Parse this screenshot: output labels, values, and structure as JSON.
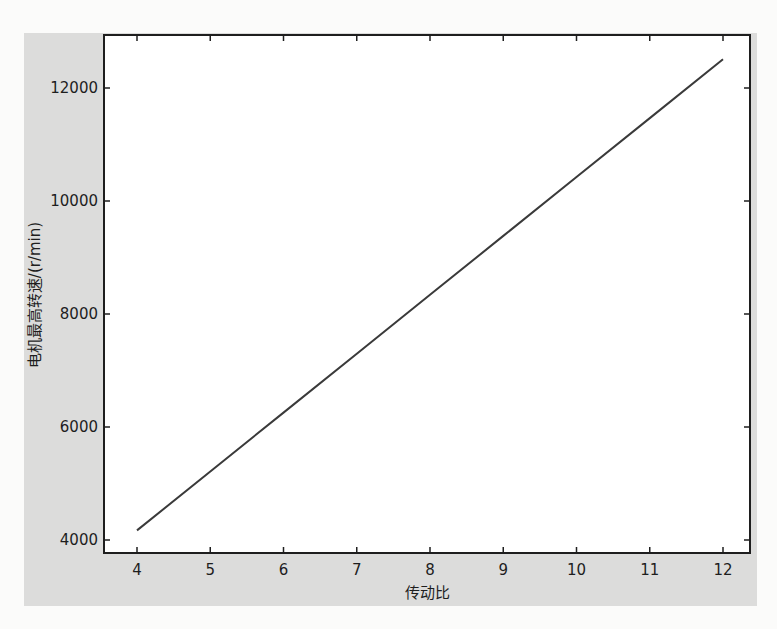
{
  "chart_data": {
    "type": "line",
    "title": "",
    "xlabel": "传动比",
    "ylabel": "电机最高转速/(r/min)",
    "xlim": [
      3.55,
      12.35
    ],
    "ylim": [
      3770,
      13000
    ],
    "x_ticks": [
      4,
      5,
      6,
      7,
      8,
      9,
      10,
      11,
      12
    ],
    "y_ticks": [
      4000,
      6000,
      8000,
      10000,
      12000
    ],
    "grid": false,
    "legend": null,
    "series": [
      {
        "name": "电机最高转速",
        "color": "#3a3a3a",
        "x": [
          4,
          5,
          6,
          7,
          8,
          9,
          10,
          11,
          12
        ],
        "y": [
          4170,
          5213,
          6255,
          7298,
          8340,
          9383,
          10425,
          11468,
          12510
        ]
      }
    ]
  },
  "labels": {
    "xlabel": "传动比",
    "ylabel": "电机最高转速/(r/min)",
    "x_ticks": [
      "4",
      "5",
      "6",
      "7",
      "8",
      "9",
      "10",
      "11",
      "12"
    ],
    "y_ticks": [
      "4000",
      "6000",
      "8000",
      "10000",
      "12000"
    ]
  },
  "colors": {
    "panel": "#dcdcdb",
    "plot_area": "#ffffff",
    "axis": "#1e1e1e",
    "line": "#3a3a3a"
  }
}
